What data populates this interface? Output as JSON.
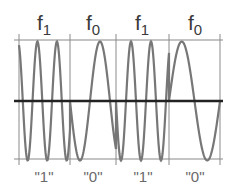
{
  "diagram": {
    "segments": [
      {
        "freq_base": "f",
        "freq_sub": "1",
        "bit": "\"1\"",
        "x0": 19,
        "x1": 70,
        "period": 19.5,
        "phase_start": "top"
      },
      {
        "freq_base": "f",
        "freq_sub": "0",
        "bit": "\"0\"",
        "x0": 70,
        "x1": 116,
        "period": 40,
        "phase_start": "mid-down"
      },
      {
        "freq_base": "f",
        "freq_sub": "1",
        "bit": "\"1\"",
        "x0": 116,
        "x1": 169,
        "period": 20,
        "phase_start": "mid-down"
      },
      {
        "freq_base": "f",
        "freq_sub": "0",
        "bit": "\"0\"",
        "x0": 169,
        "x1": 220,
        "period": 51,
        "phase_start": "mid-up"
      }
    ],
    "grid": {
      "top_y": 40,
      "mid_y": 101,
      "bottom_y": 159,
      "left_x": 14,
      "right_x": 223,
      "dividers": [
        19,
        70,
        116,
        169,
        220
      ]
    },
    "colors": {
      "wave": "#777777",
      "grid": "#8a8a8a",
      "axis": "#222222"
    }
  }
}
